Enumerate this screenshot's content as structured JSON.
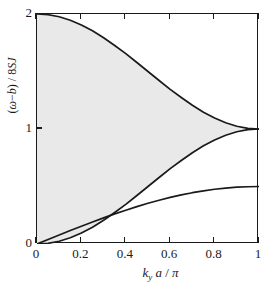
{
  "figure": {
    "title_remnant": "",
    "background_color": "#ffffff",
    "axis_color": "#1a1a1a",
    "shade_color": "#e9e9e9",
    "curve_color": "#1a1a1a"
  },
  "axes": {
    "x": {
      "label_parts": {
        "symbol": "k",
        "subscript": "y",
        "rest": "a /",
        "pi": "π"
      },
      "label": "k_y a / π",
      "ticks": [
        "0",
        "0.2",
        "0.4",
        "0.6",
        "0.8",
        "1"
      ],
      "tick_values": [
        0,
        0.2,
        0.4,
        0.6,
        0.8,
        1
      ],
      "min": 0,
      "max": 1
    },
    "y": {
      "label": "(ω−b) / 8SJ",
      "ticks": [
        "0",
        "1",
        "2"
      ],
      "tick_values": [
        0,
        1,
        2
      ],
      "min": 0,
      "max": 2
    }
  },
  "chart_data": {
    "type": "line",
    "title": "",
    "xlabel": "k_y a / π",
    "ylabel": "(ω−b) / 8SJ",
    "xlim": [
      0,
      1
    ],
    "ylim": [
      0,
      2
    ],
    "grid": false,
    "legend": "none",
    "shaded_region": {
      "name": "continuum",
      "color": "#e9e9e9",
      "upper_series": "upper-branch",
      "lower_series": "lower-branch"
    },
    "x": [
      0,
      0.05,
      0.1,
      0.15,
      0.2,
      0.25,
      0.3,
      0.35,
      0.4,
      0.45,
      0.5,
      0.55,
      0.6,
      0.65,
      0.7,
      0.75,
      0.8,
      0.85,
      0.9,
      0.95,
      1
    ],
    "series": [
      {
        "name": "upper-branch",
        "description": "upper boundary of shaded continuum, 1 + cos^2(pi*k/2)",
        "values": [
          2,
          1.994,
          1.976,
          1.946,
          1.905,
          1.854,
          1.794,
          1.726,
          1.655,
          1.578,
          1.5,
          1.422,
          1.345,
          1.274,
          1.206,
          1.146,
          1.095,
          1.054,
          1.024,
          1.006,
          1
        ]
      },
      {
        "name": "lower-branch",
        "description": "lower boundary of shaded continuum, sin^2(pi*k/2)",
        "values": [
          0,
          0.006,
          0.024,
          0.054,
          0.095,
          0.146,
          0.206,
          0.274,
          0.345,
          0.422,
          0.5,
          0.578,
          0.655,
          0.726,
          0.794,
          0.854,
          0.905,
          0.946,
          0.976,
          0.994,
          1
        ]
      },
      {
        "name": "magnon-mode",
        "description": "single-mode dispersion saturating near 0.5, 0.5*sin(pi*k/2)",
        "values": [
          0,
          0.039,
          0.078,
          0.117,
          0.155,
          0.191,
          0.227,
          0.262,
          0.294,
          0.325,
          0.354,
          0.38,
          0.405,
          0.427,
          0.446,
          0.462,
          0.476,
          0.486,
          0.494,
          0.498,
          0.5
        ]
      }
    ]
  }
}
